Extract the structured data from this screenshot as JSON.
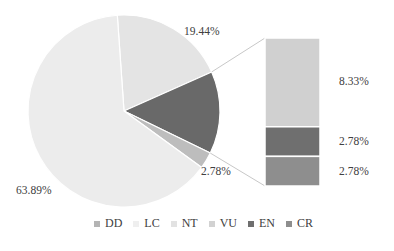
{
  "chart_data": {
    "type": "pie",
    "subtype": "bar-of-pie",
    "title": "",
    "pie": {
      "slices": [
        {
          "name": "NT",
          "value": 19.44,
          "label": "19.44%",
          "color": "#e4e4e4"
        },
        {
          "name": "Other (VU+EN+CR)",
          "value": 13.89,
          "label": "",
          "color": "#696969"
        },
        {
          "name": "DD",
          "value": 2.78,
          "label": "2.78%",
          "color": "#bdbdbd"
        },
        {
          "name": "LC",
          "value": 63.89,
          "label": "63.89%",
          "color": "#ececec"
        }
      ]
    },
    "bar": {
      "segments": [
        {
          "name": "VU",
          "value": 8.33,
          "label": "8.33%",
          "color": "#d0d0d0"
        },
        {
          "name": "EN",
          "value": 2.78,
          "label": "2.78%",
          "color": "#6f6f6f"
        },
        {
          "name": "CR",
          "value": 2.78,
          "label": "2.78%",
          "color": "#8e8e8e"
        }
      ]
    },
    "legend": [
      {
        "name": "DD",
        "color": "#b4b4b4"
      },
      {
        "name": "LC",
        "color": "#efefef"
      },
      {
        "name": "NT",
        "color": "#e2e2e2"
      },
      {
        "name": "VU",
        "color": "#d2d2d2"
      },
      {
        "name": "EN",
        "color": "#6f6f6f"
      },
      {
        "name": "CR",
        "color": "#8e8e8e"
      }
    ],
    "legend_position": "bottom"
  },
  "labels": {
    "nt": "19.44%",
    "dd": "2.78%",
    "lc": "63.89%",
    "vu": "8.33%",
    "en": "2.78%",
    "cr": "2.78%"
  }
}
